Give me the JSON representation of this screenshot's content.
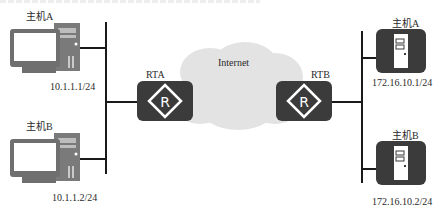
{
  "diagram": {
    "left_network": {
      "hosts": [
        {
          "name": "主机A",
          "ip": "10.1.1.1/24",
          "type": "pc"
        },
        {
          "name": "主机B",
          "ip": "10.1.1.2/24",
          "type": "pc"
        }
      ]
    },
    "routers": [
      {
        "name": "RTA",
        "icon": "router-icon",
        "glyph": "R"
      },
      {
        "name": "RTB",
        "icon": "router-icon",
        "glyph": "R"
      }
    ],
    "cloud": {
      "label": "Internet"
    },
    "right_network": {
      "hosts": [
        {
          "name": "主机A",
          "ip": "172.16.10.1/24",
          "type": "server"
        },
        {
          "name": "主机B",
          "ip": "172.16.10.2/24",
          "type": "server"
        }
      ]
    },
    "colors": {
      "device_fill": "#3b3b3b",
      "line": "#1a1a1a",
      "cloud": "#e3e3e3",
      "pc_fill": "#7a7a7a"
    }
  }
}
